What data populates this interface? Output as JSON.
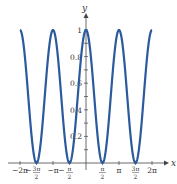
{
  "chart_data": {
    "type": "line",
    "title": "",
    "function": "y = cos^2(x)",
    "xlabel": "x",
    "ylabel": "y",
    "xlim": [
      -6.2832,
      6.2832
    ],
    "ylim": [
      0,
      1
    ],
    "grid": false,
    "legend": null,
    "x_ticks": [
      {
        "value": -6.2832,
        "label": "−2π"
      },
      {
        "value": -4.7124,
        "label": "−3π/2"
      },
      {
        "value": -3.1416,
        "label": "−π"
      },
      {
        "value": -1.5708,
        "label": "−π/2"
      },
      {
        "value": 1.5708,
        "label": "π/2"
      },
      {
        "value": 3.1416,
        "label": "π"
      },
      {
        "value": 4.7124,
        "label": "3π/2"
      },
      {
        "value": 6.2832,
        "label": "2π"
      }
    ],
    "y_ticks": [
      {
        "value": 0.2,
        "label": "0.2"
      },
      {
        "value": 0.4,
        "label": "0.4"
      },
      {
        "value": 0.6,
        "label": "0.6"
      },
      {
        "value": 0.8,
        "label": "0.8"
      },
      {
        "value": 1.0,
        "label": "1"
      }
    ],
    "series": [
      {
        "name": "cos^2(x)",
        "color": "#2b5b9c",
        "x": [
          -6.2832,
          -5.4978,
          -4.7124,
          -3.927,
          -3.1416,
          -2.3562,
          -1.5708,
          -0.7854,
          0,
          0.7854,
          1.5708,
          2.3562,
          3.1416,
          3.927,
          4.7124,
          5.4978,
          6.2832
        ],
        "values": [
          1,
          0.5,
          0,
          0.5,
          1,
          0.5,
          0,
          0.5,
          1,
          0.5,
          0,
          0.5,
          1,
          0.5,
          0,
          0.5,
          1
        ]
      }
    ]
  }
}
